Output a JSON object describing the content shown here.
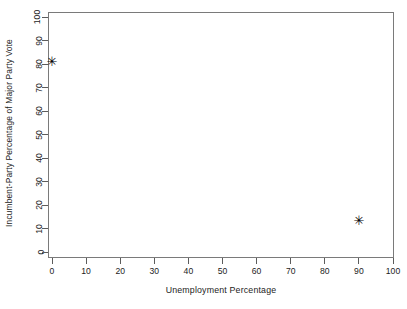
{
  "chart_data": {
    "type": "scatter",
    "title": "",
    "xlabel": "Unemployment Percentage",
    "ylabel": "Incumbent-Party Percentage of Major Party Vote",
    "xlim": [
      0,
      100
    ],
    "ylim": [
      0,
      100
    ],
    "xticks": [
      0,
      10,
      20,
      30,
      40,
      50,
      60,
      70,
      80,
      90,
      100
    ],
    "yticks": [
      0,
      10,
      20,
      30,
      40,
      50,
      60,
      70,
      80,
      90,
      100
    ],
    "xtick_labels": [
      "0",
      "10",
      "20",
      "30",
      "40",
      "50",
      "60",
      "70",
      "80",
      "90",
      "100"
    ],
    "ytick_labels": [
      "0",
      "10",
      "20",
      "30",
      "40",
      "50",
      "60",
      "70",
      "80",
      "90",
      "100"
    ],
    "grid": false,
    "legend": null,
    "marker": "asterisk",
    "marker_glyph": "✳",
    "marker_color": "#000000",
    "frame_color": "#7a7a7a",
    "background": "#ffffff",
    "points": [
      {
        "x": 0,
        "y": 81
      },
      {
        "x": 90,
        "y": 13
      }
    ]
  }
}
